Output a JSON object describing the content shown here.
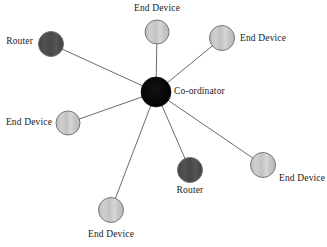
{
  "diagram": {
    "background_color": "#ffffff",
    "edge_color": "#5a5a5a",
    "colors": {
      "coordinator_fill": "#050505",
      "router_fill": "#4a4a4a",
      "end_device_fill": "#c9c9c9",
      "node_stroke": "#6b6b6b",
      "coordinator_stroke": "#000000",
      "label_text": "#1a1a1a"
    },
    "center": {
      "id": "coordinator",
      "label": "Co-ordinator",
      "role": "coordinator",
      "cx": 156,
      "cy": 92,
      "r": 15,
      "label_x": 174,
      "label_y": 92,
      "label_anchor": "left"
    },
    "nodes": [
      {
        "id": "end-device-top",
        "label": "End Device",
        "role": "end-device",
        "cx": 157,
        "cy": 32,
        "r": 12,
        "label_x": 157,
        "label_y": 9,
        "label_anchor": "center"
      },
      {
        "id": "router-top-left",
        "label": "Router",
        "role": "router",
        "cx": 51,
        "cy": 44,
        "r": 12.5,
        "label_x": 33,
        "label_y": 42,
        "label_anchor": "right"
      },
      {
        "id": "end-device-top-right",
        "label": "End Device",
        "role": "end-device",
        "cx": 222,
        "cy": 38,
        "r": 12.5,
        "label_x": 240,
        "label_y": 39,
        "label_anchor": "left"
      },
      {
        "id": "end-device-left",
        "label": "End Device",
        "role": "end-device",
        "cx": 68,
        "cy": 123,
        "r": 12,
        "label_x": 52,
        "label_y": 123,
        "label_anchor": "right"
      },
      {
        "id": "end-device-bottom-left",
        "label": "End Device",
        "role": "end-device",
        "cx": 111,
        "cy": 210,
        "r": 12.5,
        "label_x": 111,
        "label_y": 235,
        "label_anchor": "center"
      },
      {
        "id": "router-bottom",
        "label": "Router",
        "role": "router",
        "cx": 190,
        "cy": 170,
        "r": 12.5,
        "label_x": 190,
        "label_y": 191,
        "label_anchor": "center"
      },
      {
        "id": "end-device-bottom-right",
        "label": "End Device",
        "role": "end-device",
        "cx": 263,
        "cy": 165,
        "r": 12.5,
        "label_x": 279,
        "label_y": 179,
        "label_anchor": "left"
      }
    ],
    "edges": [
      {
        "from": "coordinator",
        "to": "end-device-top"
      },
      {
        "from": "coordinator",
        "to": "router-top-left"
      },
      {
        "from": "coordinator",
        "to": "end-device-top-right"
      },
      {
        "from": "coordinator",
        "to": "end-device-left"
      },
      {
        "from": "coordinator",
        "to": "end-device-bottom-left"
      },
      {
        "from": "coordinator",
        "to": "router-bottom"
      },
      {
        "from": "coordinator",
        "to": "end-device-bottom-right"
      }
    ]
  }
}
